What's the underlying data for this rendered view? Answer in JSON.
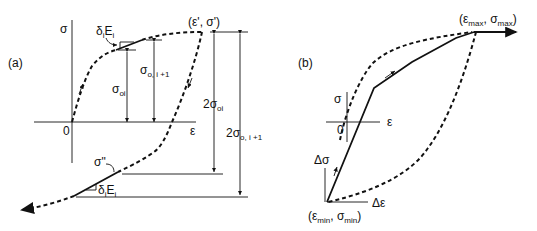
{
  "panel_a": {
    "label": "(a)",
    "axis_y": "σ",
    "axis_x": "ε",
    "origin": "0",
    "peak_point": "(ε', σ')",
    "reversal_point": "σ\"",
    "slope_top": {
      "base": "δ",
      "sub": "i",
      "tail": "E",
      "tail_sub": "i"
    },
    "slope_bottom": {
      "base": "δ",
      "sub": "i",
      "tail": "E",
      "tail_sub": "i"
    },
    "sigma_oi": {
      "base": "σ",
      "sub": "oi"
    },
    "sigma_o_i1": {
      "base": "σ",
      "sub": "o, i +1"
    },
    "two_sigma_oi": {
      "base": "2σ",
      "sub": "oi"
    },
    "two_sigma_o_i1": {
      "base": "2σ",
      "sub": "o, i +1"
    }
  },
  "panel_b": {
    "label": "(b)",
    "axis_y": "σ",
    "axis_x": "ε",
    "origin": "0",
    "max_point": {
      "open": "(ε",
      "sub1": "max",
      "mid": ", σ",
      "sub2": "max",
      "close": ")"
    },
    "min_point": {
      "open": "(ε",
      "sub1": "min",
      "mid": ", σ",
      "sub2": "min",
      "close": ")"
    },
    "delta_sigma": "Δσ",
    "delta_eps": "Δε"
  }
}
